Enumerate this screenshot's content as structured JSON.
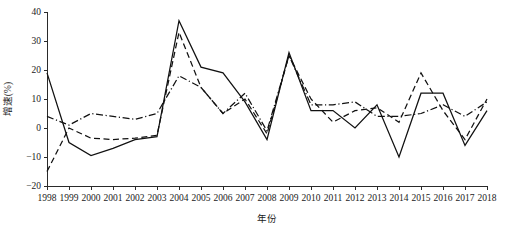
{
  "chart_data": {
    "type": "line",
    "title": "",
    "xlabel": "年份",
    "ylabel": "增速(%)",
    "xlim": [
      1998,
      2018
    ],
    "ylim": [
      -20,
      40
    ],
    "yticks": [
      -20,
      -10,
      0,
      10,
      20,
      30,
      40
    ],
    "ytick_labels": [
      "−20",
      "−10",
      "0",
      "10",
      "20",
      "30",
      "40"
    ],
    "grid": false,
    "legend": "none",
    "x": [
      1998,
      1999,
      2000,
      2001,
      2002,
      2003,
      2004,
      2005,
      2006,
      2007,
      2008,
      2009,
      2010,
      2011,
      2012,
      2013,
      2014,
      2015,
      2016,
      2017,
      2018
    ],
    "categories": [
      "1998",
      "1999",
      "2000",
      "2001",
      "2002",
      "2003",
      "2004",
      "2005",
      "2006",
      "2007",
      "2008",
      "2009",
      "2010",
      "2011",
      "2012",
      "2013",
      "2014",
      "2015",
      "2016",
      "2017",
      "2018"
    ],
    "series": [
      {
        "name": "series-1",
        "style": "solid",
        "values": [
          19,
          -5,
          -9.5,
          -7,
          -4,
          -3,
          37,
          21,
          19,
          9,
          -4,
          26,
          6,
          6,
          0,
          8,
          -10,
          12,
          12,
          -6,
          6
        ]
      },
      {
        "name": "series-2",
        "style": "dashed",
        "values": [
          -15,
          0,
          -3.5,
          -4,
          -3.5,
          -2.5,
          33,
          14,
          5,
          10,
          -2,
          25,
          10,
          2,
          6,
          7,
          2,
          19,
          6,
          -4,
          10
        ]
      },
      {
        "name": "series-3",
        "style": "dash-dot",
        "values": [
          4,
          1,
          5,
          4,
          3,
          5,
          18,
          14,
          5,
          12,
          -1,
          25,
          8,
          8,
          9,
          4,
          4,
          5,
          8,
          4,
          9
        ]
      }
    ]
  },
  "axes": {
    "y_title": "增速(%)",
    "x_title": "年份",
    "y_tick_labels": [
      "40",
      "30",
      "20",
      "10",
      "0",
      "−10",
      "−20"
    ],
    "x_tick_labels": [
      "1998",
      "1999",
      "2000",
      "2001",
      "2002",
      "2003",
      "2004",
      "2005",
      "2006",
      "2007",
      "2008",
      "2009",
      "2010",
      "2011",
      "2012",
      "2013",
      "2014",
      "2015",
      "2016",
      "2017",
      "2018"
    ]
  },
  "colors": {
    "line": "#111111",
    "axis": "#2a2a2a",
    "background": "#ffffff"
  }
}
